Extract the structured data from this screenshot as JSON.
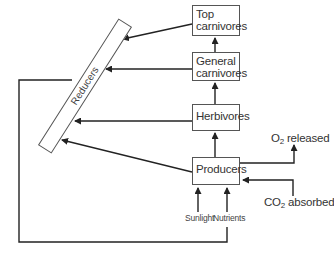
{
  "diagram": {
    "type": "energy-flow / food web",
    "nodes": {
      "top_carnivores": {
        "line1": "Top",
        "line2": "carnivores"
      },
      "general_carnivores": {
        "line1": "General",
        "line2": "carnivores"
      },
      "herbivores": {
        "label": "Herbivores"
      },
      "producers": {
        "label": "Producers"
      },
      "reducers": {
        "label": "Reducers"
      }
    },
    "inputs": {
      "sunlight": "Sunlight",
      "nutrients": "Nutrients",
      "co2": {
        "prefix": "CO",
        "sub": "2",
        "suffix": " absorbed"
      }
    },
    "outputs": {
      "o2": {
        "prefix": "O",
        "sub": "2",
        "suffix": " released"
      }
    },
    "edges": [
      {
        "from": "Producers",
        "to": "Herbivores"
      },
      {
        "from": "Herbivores",
        "to": "General carnivores"
      },
      {
        "from": "General carnivores",
        "to": "Top carnivores"
      },
      {
        "from": "Top carnivores",
        "to": "Reducers"
      },
      {
        "from": "General carnivores",
        "to": "Reducers"
      },
      {
        "from": "Herbivores",
        "to": "Reducers"
      },
      {
        "from": "Producers",
        "to": "Reducers"
      },
      {
        "from": "Reducers",
        "to": "Nutrients"
      },
      {
        "from": "Sunlight",
        "to": "Producers"
      },
      {
        "from": "Nutrients",
        "to": "Producers"
      },
      {
        "from": "CO2 absorbed",
        "to": "Producers"
      },
      {
        "from": "Producers",
        "to": "O2 released"
      }
    ]
  }
}
